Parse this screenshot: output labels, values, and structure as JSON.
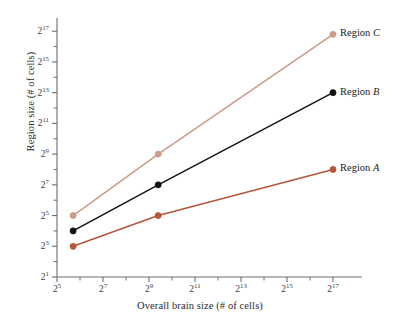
{
  "chart_data": {
    "type": "line",
    "title": "",
    "xlabel": "Overall brain size (# of cells)",
    "ylabel": "Region size (# of cells)",
    "x_scale": "log2",
    "y_scale": "log2",
    "xlim_exp": [
      5,
      18
    ],
    "ylim_exp": [
      1,
      17.6
    ],
    "grid": false,
    "legend_position": "right-of-line-ends",
    "x_tick_labels": [
      "2^5",
      "2^7",
      "2^9",
      "2^11",
      "2^13",
      "2^15",
      "2^17"
    ],
    "x_tick_exponents": [
      5,
      7,
      9,
      11,
      13,
      15,
      17
    ],
    "x_minor_tick_exponents": [
      6,
      8,
      10,
      12,
      14,
      16
    ],
    "y_tick_labels": [
      "2^1",
      "2^3",
      "2^5",
      "2^7",
      "2^9",
      "2^11",
      "2^13",
      "2^15",
      "2^17"
    ],
    "y_tick_exponents": [
      1,
      3,
      5,
      7,
      9,
      11,
      13,
      15,
      17
    ],
    "series": [
      {
        "name": "Region A",
        "color": "#b5553a",
        "x_exponents": [
          5.7,
          9.4,
          17.0
        ],
        "y_exponents": [
          3.0,
          5.0,
          8.0
        ],
        "x_values_label": [
          "2^5.7",
          "2^9.4",
          "2^17"
        ],
        "y_values_label": [
          "2^3",
          "2^5",
          "2^8"
        ]
      },
      {
        "name": "Region B",
        "color": "#141414",
        "x_exponents": [
          5.7,
          9.4,
          17.0
        ],
        "y_exponents": [
          4.0,
          7.0,
          13.0
        ],
        "x_values_label": [
          "2^5.7",
          "2^9.4",
          "2^17"
        ],
        "y_values_label": [
          "2^4",
          "2^7",
          "2^13"
        ]
      },
      {
        "name": "Region C",
        "color": "#cc9a88",
        "x_exponents": [
          5.7,
          9.4,
          17.0
        ],
        "y_exponents": [
          5.0,
          9.0,
          16.8
        ],
        "x_values_label": [
          "2^5.7",
          "2^9.4",
          "2^17"
        ],
        "y_values_label": [
          "2^5",
          "2^9",
          "2^17"
        ]
      }
    ]
  },
  "axis": {
    "x_title": "Overall brain size (# of cells)",
    "y_title": "Region size (# of cells)",
    "y_ticks": [
      {
        "base": "2",
        "exp": "1"
      },
      {
        "base": "2",
        "exp": "3"
      },
      {
        "base": "2",
        "exp": "5"
      },
      {
        "base": "2",
        "exp": "7"
      },
      {
        "base": "2",
        "exp": "9"
      },
      {
        "base": "2",
        "exp": "11"
      },
      {
        "base": "2",
        "exp": "13"
      },
      {
        "base": "2",
        "exp": "15"
      },
      {
        "base": "2",
        "exp": "17"
      }
    ],
    "x_ticks": [
      {
        "base": "2",
        "exp": "5"
      },
      {
        "base": "2",
        "exp": "7"
      },
      {
        "base": "2",
        "exp": "9"
      },
      {
        "base": "2",
        "exp": "11"
      },
      {
        "base": "2",
        "exp": "13"
      },
      {
        "base": "2",
        "exp": "15"
      },
      {
        "base": "2",
        "exp": "17"
      }
    ]
  },
  "series_labels": [
    {
      "prefix": "Region ",
      "letter": "C"
    },
    {
      "prefix": "Region ",
      "letter": "B"
    },
    {
      "prefix": "Region ",
      "letter": "A"
    }
  ],
  "colors": {
    "region_a": "#b5553a",
    "region_b": "#141414",
    "region_c": "#cc9a88",
    "axis": "#6e6e6e",
    "text": "#2b2b2b",
    "background": "#ffffff"
  }
}
